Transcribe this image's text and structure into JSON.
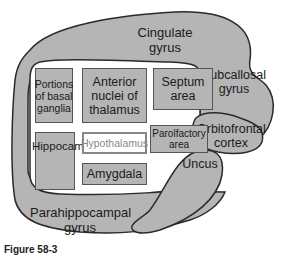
{
  "diagram": {
    "type": "limbic system anatomy",
    "colors": {
      "region_fill": "#b5b5b5",
      "outline": "#2a2a2a",
      "background": "#ffffff",
      "highlight_box": "#ffffff"
    },
    "outer_regions": {
      "cingulate": "Cingulate gyrus",
      "subcallosal": "Subcallosal gyrus",
      "orbitofrontal": "Orbitofrontal cortex",
      "uncus": "Uncus",
      "parahippocampal": "Parahippocampal gyrus"
    },
    "boxes": {
      "basal_ganglia": "Portions of basal ganglia",
      "anterior_nuclei": "Anterior nuclei of thalamus",
      "septum": "Septum area",
      "hippocampus": "Hippocampus",
      "hypothalamus": "Hypothalamus",
      "parolfactory": "Parolfactory area",
      "amygdala": "Amygdala"
    },
    "caption": "Figure 58-3"
  }
}
